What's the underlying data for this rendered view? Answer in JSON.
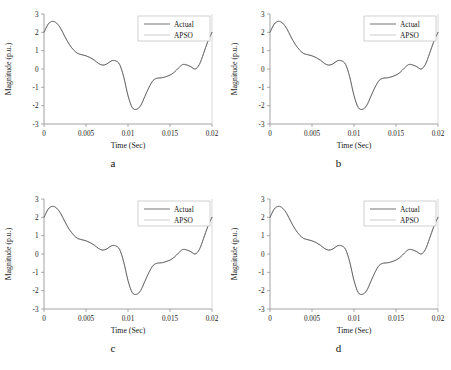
{
  "figure": {
    "background": "#ffffff",
    "panel_count": 4
  },
  "panels": [
    {
      "letter": "a"
    },
    {
      "letter": "b"
    },
    {
      "letter": "c"
    },
    {
      "letter": "d"
    }
  ],
  "chart_data": [
    {
      "type": "line",
      "title": "",
      "panel_label": "a",
      "xlabel": "Time (Sec)",
      "ylabel": "Magnitude (p.u.)",
      "xlim": [
        0,
        0.02
      ],
      "ylim": [
        -3,
        3
      ],
      "xticks": [
        0,
        0.005,
        0.01,
        0.015,
        0.02
      ],
      "xticklabels": [
        "0",
        "0.005",
        "0.01",
        "0.015",
        "0.02"
      ],
      "yticks": [
        -3,
        -2,
        -1,
        0,
        1,
        2,
        3
      ],
      "yticklabels": [
        "-3",
        "-2",
        "-1",
        "0",
        "1",
        "2",
        "3"
      ],
      "grid": false,
      "legend_position": "upper right",
      "legend": [
        "Actual",
        "APSO"
      ],
      "x": [
        0,
        0.0005,
        0.001,
        0.0015,
        0.002,
        0.0025,
        0.003,
        0.0035,
        0.004,
        0.0045,
        0.005,
        0.0055,
        0.006,
        0.0065,
        0.007,
        0.0075,
        0.008,
        0.0085,
        0.009,
        0.0095,
        0.01,
        0.0105,
        0.011,
        0.0115,
        0.012,
        0.0125,
        0.013,
        0.0135,
        0.014,
        0.0145,
        0.015,
        0.0155,
        0.016,
        0.0165,
        0.017,
        0.0175,
        0.018,
        0.0185,
        0.019,
        0.0195,
        0.02
      ],
      "series": [
        {
          "name": "Actual",
          "color": "#5c5c5c",
          "values": [
            2.0,
            2.45,
            2.6,
            2.5,
            2.2,
            1.75,
            1.35,
            1.05,
            0.85,
            0.78,
            0.72,
            0.62,
            0.48,
            0.3,
            0.21,
            0.28,
            0.44,
            0.45,
            0.25,
            -0.45,
            -1.45,
            -2.1,
            -2.2,
            -2.0,
            -1.5,
            -1.0,
            -0.62,
            -0.5,
            -0.48,
            -0.42,
            -0.33,
            -0.18,
            0.05,
            0.24,
            0.22,
            0.12,
            0.0,
            0.25,
            0.85,
            1.5,
            2.0
          ]
        },
        {
          "name": "APSO",
          "color": "#b4b4b4",
          "values": [
            2.0,
            2.45,
            2.6,
            2.5,
            2.2,
            1.75,
            1.35,
            1.05,
            0.85,
            0.78,
            0.72,
            0.62,
            0.48,
            0.3,
            0.21,
            0.28,
            0.44,
            0.45,
            0.25,
            -0.45,
            -1.45,
            -2.1,
            -2.2,
            -2.0,
            -1.5,
            -1.0,
            -0.62,
            -0.5,
            -0.48,
            -0.42,
            -0.33,
            -0.18,
            0.05,
            0.24,
            0.22,
            0.12,
            0.0,
            0.25,
            0.85,
            1.5,
            2.0
          ]
        }
      ]
    },
    {
      "type": "line",
      "title": "",
      "panel_label": "b",
      "xlabel": "Time (Sec)",
      "ylabel": "Magnitude (p.u.)",
      "xlim": [
        0,
        0.02
      ],
      "ylim": [
        -3,
        3
      ],
      "xticks": [
        0,
        0.005,
        0.01,
        0.015,
        0.02
      ],
      "xticklabels": [
        "0",
        "0.005",
        "0.01",
        "0.015",
        "0.02"
      ],
      "yticks": [
        -3,
        -2,
        -1,
        0,
        1,
        2,
        3
      ],
      "yticklabels": [
        "-3",
        "-2",
        "-1",
        "0",
        "1",
        "2",
        "3"
      ],
      "grid": false,
      "legend_position": "upper right",
      "legend": [
        "Actual",
        "APSO"
      ],
      "x": [
        0,
        0.0005,
        0.001,
        0.0015,
        0.002,
        0.0025,
        0.003,
        0.0035,
        0.004,
        0.0045,
        0.005,
        0.0055,
        0.006,
        0.0065,
        0.007,
        0.0075,
        0.008,
        0.0085,
        0.009,
        0.0095,
        0.01,
        0.0105,
        0.011,
        0.0115,
        0.012,
        0.0125,
        0.013,
        0.0135,
        0.014,
        0.0145,
        0.015,
        0.0155,
        0.016,
        0.0165,
        0.017,
        0.0175,
        0.018,
        0.0185,
        0.019,
        0.0195,
        0.02
      ],
      "series": [
        {
          "name": "Actual",
          "color": "#5c5c5c",
          "values": [
            2.0,
            2.45,
            2.6,
            2.5,
            2.2,
            1.75,
            1.35,
            1.05,
            0.85,
            0.78,
            0.72,
            0.62,
            0.48,
            0.3,
            0.21,
            0.28,
            0.44,
            0.45,
            0.25,
            -0.45,
            -1.45,
            -2.1,
            -2.2,
            -2.0,
            -1.5,
            -1.0,
            -0.62,
            -0.5,
            -0.48,
            -0.42,
            -0.33,
            -0.18,
            0.05,
            0.24,
            0.22,
            0.12,
            0.0,
            0.25,
            0.85,
            1.5,
            2.0
          ]
        },
        {
          "name": "APSO",
          "color": "#b4b4b4",
          "values": [
            2.0,
            2.45,
            2.6,
            2.5,
            2.2,
            1.75,
            1.35,
            1.05,
            0.85,
            0.78,
            0.72,
            0.62,
            0.48,
            0.3,
            0.21,
            0.28,
            0.44,
            0.45,
            0.25,
            -0.45,
            -1.45,
            -2.1,
            -2.2,
            -2.0,
            -1.5,
            -1.0,
            -0.62,
            -0.5,
            -0.48,
            -0.42,
            -0.33,
            -0.18,
            0.05,
            0.24,
            0.22,
            0.12,
            0.0,
            0.25,
            0.85,
            1.5,
            2.0
          ]
        }
      ]
    },
    {
      "type": "line",
      "title": "",
      "panel_label": "c",
      "xlabel": "Time (Sec)",
      "ylabel": "Magnitude (p.u.)",
      "xlim": [
        0,
        0.02
      ],
      "ylim": [
        -3,
        3
      ],
      "xticks": [
        0,
        0.005,
        0.01,
        0.015,
        0.02
      ],
      "xticklabels": [
        "0",
        "0.005",
        "0.01",
        "0.015",
        "0.02"
      ],
      "yticks": [
        -3,
        -2,
        -1,
        0,
        1,
        2,
        3
      ],
      "yticklabels": [
        "-3",
        "-2",
        "-1",
        "0",
        "1",
        "2",
        "3"
      ],
      "grid": false,
      "legend_position": "upper right",
      "legend": [
        "Actual",
        "APSO"
      ],
      "x": [
        0,
        0.0005,
        0.001,
        0.0015,
        0.002,
        0.0025,
        0.003,
        0.0035,
        0.004,
        0.0045,
        0.005,
        0.0055,
        0.006,
        0.0065,
        0.007,
        0.0075,
        0.008,
        0.0085,
        0.009,
        0.0095,
        0.01,
        0.0105,
        0.011,
        0.0115,
        0.012,
        0.0125,
        0.013,
        0.0135,
        0.014,
        0.0145,
        0.015,
        0.0155,
        0.016,
        0.0165,
        0.017,
        0.0175,
        0.018,
        0.0185,
        0.019,
        0.0195,
        0.02
      ],
      "series": [
        {
          "name": "Actual",
          "color": "#5c5c5c",
          "values": [
            2.0,
            2.45,
            2.6,
            2.5,
            2.2,
            1.75,
            1.35,
            1.05,
            0.85,
            0.78,
            0.72,
            0.62,
            0.48,
            0.3,
            0.21,
            0.28,
            0.44,
            0.45,
            0.25,
            -0.45,
            -1.45,
            -2.1,
            -2.2,
            -2.0,
            -1.5,
            -1.0,
            -0.62,
            -0.5,
            -0.48,
            -0.42,
            -0.33,
            -0.18,
            0.05,
            0.24,
            0.22,
            0.12,
            0.0,
            0.25,
            0.85,
            1.5,
            2.0
          ]
        },
        {
          "name": "APSO",
          "color": "#b4b4b4",
          "values": [
            2.0,
            2.45,
            2.6,
            2.5,
            2.2,
            1.75,
            1.35,
            1.05,
            0.85,
            0.78,
            0.72,
            0.62,
            0.48,
            0.3,
            0.21,
            0.28,
            0.44,
            0.45,
            0.25,
            -0.45,
            -1.45,
            -2.1,
            -2.2,
            -2.0,
            -1.5,
            -1.0,
            -0.62,
            -0.5,
            -0.48,
            -0.42,
            -0.33,
            -0.18,
            0.05,
            0.24,
            0.22,
            0.12,
            0.0,
            0.25,
            0.85,
            1.5,
            2.0
          ]
        }
      ]
    },
    {
      "type": "line",
      "title": "",
      "panel_label": "d",
      "xlabel": "Time (Sec)",
      "ylabel": "Magnitude (p.u.)",
      "xlim": [
        0,
        0.02
      ],
      "ylim": [
        -3,
        3
      ],
      "xticks": [
        0,
        0.005,
        0.01,
        0.015,
        0.02
      ],
      "xticklabels": [
        "0",
        "0.005",
        "0.01",
        "0.015",
        "0.02"
      ],
      "yticks": [
        -3,
        -2,
        -1,
        0,
        1,
        2,
        3
      ],
      "yticklabels": [
        "-3",
        "-2",
        "-1",
        "0",
        "1",
        "2",
        "3"
      ],
      "grid": false,
      "legend_position": "upper right",
      "legend": [
        "Actual",
        "APSO"
      ],
      "x": [
        0,
        0.0005,
        0.001,
        0.0015,
        0.002,
        0.0025,
        0.003,
        0.0035,
        0.004,
        0.0045,
        0.005,
        0.0055,
        0.006,
        0.0065,
        0.007,
        0.0075,
        0.008,
        0.0085,
        0.009,
        0.0095,
        0.01,
        0.0105,
        0.011,
        0.0115,
        0.012,
        0.0125,
        0.013,
        0.0135,
        0.014,
        0.0145,
        0.015,
        0.0155,
        0.016,
        0.0165,
        0.017,
        0.0175,
        0.018,
        0.0185,
        0.019,
        0.0195,
        0.02
      ],
      "series": [
        {
          "name": "Actual",
          "color": "#5c5c5c",
          "values": [
            2.0,
            2.45,
            2.6,
            2.5,
            2.2,
            1.75,
            1.35,
            1.05,
            0.85,
            0.78,
            0.72,
            0.62,
            0.48,
            0.3,
            0.21,
            0.28,
            0.44,
            0.45,
            0.25,
            -0.45,
            -1.45,
            -2.1,
            -2.2,
            -2.0,
            -1.5,
            -1.0,
            -0.62,
            -0.5,
            -0.48,
            -0.42,
            -0.33,
            -0.18,
            0.05,
            0.24,
            0.22,
            0.12,
            0.0,
            0.25,
            0.85,
            1.5,
            2.0
          ]
        },
        {
          "name": "APSO",
          "color": "#b4b4b4",
          "values": [
            2.0,
            2.45,
            2.6,
            2.5,
            2.2,
            1.75,
            1.35,
            1.05,
            0.85,
            0.78,
            0.72,
            0.62,
            0.48,
            0.3,
            0.21,
            0.28,
            0.44,
            0.45,
            0.25,
            -0.45,
            -1.45,
            -2.1,
            -2.2,
            -2.0,
            -1.5,
            -1.0,
            -0.62,
            -0.5,
            -0.48,
            -0.42,
            -0.33,
            -0.18,
            0.05,
            0.24,
            0.22,
            0.12,
            0.0,
            0.25,
            0.85,
            1.5,
            2.0
          ]
        }
      ]
    }
  ]
}
